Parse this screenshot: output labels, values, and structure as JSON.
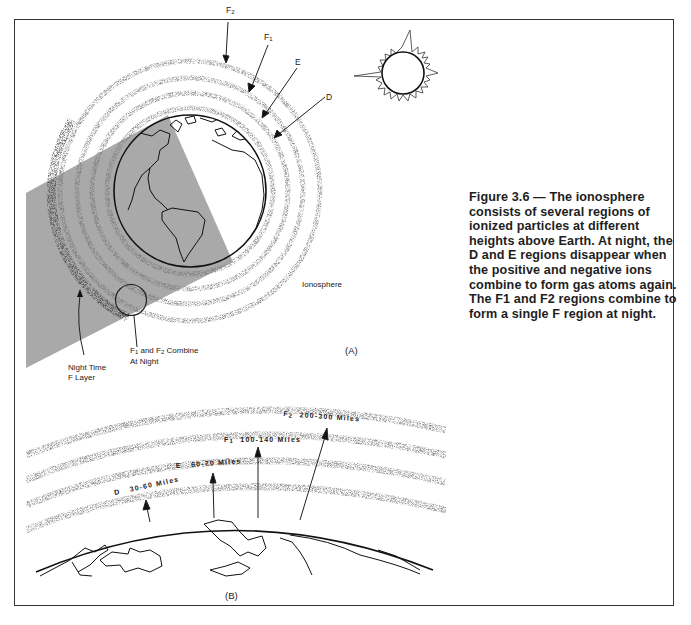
{
  "figure": {
    "number": "3.6",
    "caption": "Figure 3.6 — The ionosphere consists of several regions of ionized particles at different heights above Earth. At night, the D and E regions disappear when the positive and negative ions combine to form gas atoms again. The F1 and F2 regions combine to form a single F region at night."
  },
  "panel_a": {
    "label": "(A)",
    "layer_labels": [
      {
        "name": "F",
        "sub": "2"
      },
      {
        "name": "F",
        "sub": "1"
      },
      {
        "name": "E",
        "sub": ""
      },
      {
        "name": "D",
        "sub": ""
      }
    ],
    "ionosphere_label": "Ionosphere",
    "night_label_line1": "Night Time",
    "night_label_line2": "F Layer",
    "combine_label": {
      "part1": "F",
      "sub1": "1",
      "part2": " and F",
      "sub2": "2",
      "part3": " Combine",
      "line2": "At Night"
    }
  },
  "panel_b": {
    "label": "(B)",
    "layers": [
      {
        "name": "D",
        "sub": "",
        "range": "30-60 Miles"
      },
      {
        "name": "E",
        "sub": "",
        "range": "60-70 Miles"
      },
      {
        "name": "F",
        "sub": "1",
        "range": "100-140 Miles"
      },
      {
        "name": "F",
        "sub": "2",
        "range": "200-300 Miles"
      }
    ]
  },
  "colors": {
    "shadow": "#a9a9a9",
    "stipple": "#8a8a8a",
    "line": "#1a1a1a"
  }
}
